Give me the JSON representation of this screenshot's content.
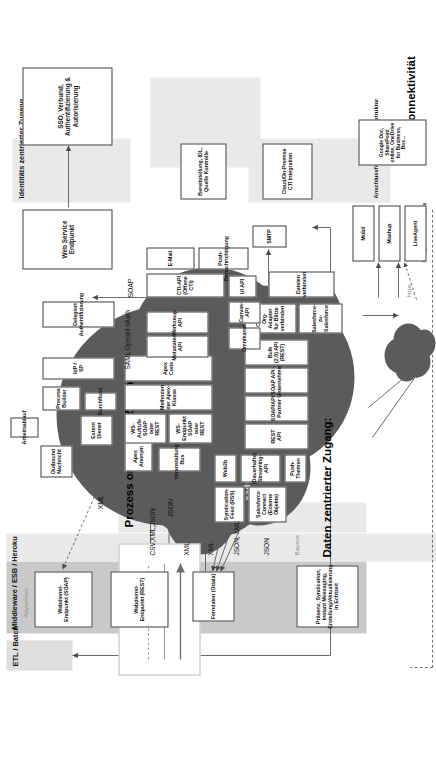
{
  "page": {
    "header_faint": "KAPITEL 6    CLOUD-SPEZIFISCHE ARCHITEKTUR",
    "language": "de"
  },
  "legend": {
    "title": "",
    "sync_label": "Sync",
    "async_label": "Asynchron",
    "arrow_icon": "arrow-up-icon"
  },
  "zones": {
    "etl_batch": "ETL / Batch",
    "middleware": "Middleware / ESB / Heroku",
    "data_centric": "Daten zentrierter Zugang:",
    "process_oriented": "Prozess orientierter Zugang",
    "identity_centric": "Identitäts zentrierter Zugang",
    "infrastructure": "Anschlussfähigkeit der Infrastruktur",
    "app_integration": "Integration von Apps",
    "cloud_connectivity": "Cloud-Konnektivität",
    "apex_side_label": "Apex"
  },
  "middleware_boxes": [
    {
      "id": "presence",
      "label": "Präsenz, Syndication, Instant Messaging, Erstellung/Aktualisierung in Echtzeit"
    },
    {
      "id": "remote-data",
      "label": "Ferndaten (Odata)"
    },
    {
      "id": "ws-rest",
      "label": "Webdienst-Endpunkt (REST)"
    },
    {
      "id": "ws-soap",
      "label": "Webdienst-Endpunkt (SOAP)"
    }
  ],
  "identity_boxes": [
    {
      "id": "sso",
      "label": "SSO, Verbund, Authentifizierung & Autorisierung"
    },
    {
      "id": "web-service-endpoint",
      "label": "Web Service Endpunkt"
    }
  ],
  "infrastructure_boxes": [
    {
      "id": "provisioning",
      "label": "Bereitstellung, IDL, Quelle Kontrolle"
    },
    {
      "id": "cti-integration",
      "label": "Cloud/On-Premise CTI Integration"
    }
  ],
  "app_boxes": [
    {
      "id": "mobil",
      "label": "Mobil"
    },
    {
      "id": "mashup",
      "label": "Mashup"
    },
    {
      "id": "liveagent",
      "label": "LiveAgent"
    }
  ],
  "cloud_boxes": {
    "data_layer": [
      {
        "id": "syndication-feed",
        "label": "Syndication-Feed (RSS)"
      },
      {
        "id": "salesforce-connect",
        "label": "Salesforce Connect (Externe Objekte)"
      },
      {
        "id": "web2b",
        "label": "Web2b"
      },
      {
        "id": "streaming-api",
        "label": "(Dauerhafte) Streaming-API"
      },
      {
        "id": "push-topics",
        "label": "Push-Themen"
      },
      {
        "id": "rest-api",
        "label": "REST API"
      },
      {
        "id": "soap-api-partner",
        "label": "SOAP/API Partner"
      },
      {
        "id": "soap-api-enterprise",
        "label": "SOAP API - Unternehmen"
      },
      {
        "id": "bulk-api",
        "label": "Bulk (2.0) API (REST)"
      },
      {
        "id": "cross-org-adapter",
        "label": "Cross-Org-Adapter für Blitze verbinden"
      },
      {
        "id": "salesforce-to-salesforce",
        "label": "Salesforce-zu-Salesforce"
      },
      {
        "id": "connect-files",
        "label": "Dateien verbinden"
      }
    ],
    "apex_layer": [
      {
        "id": "apex-anonymous",
        "label": "Apex Anonym"
      },
      {
        "id": "event-bus",
        "label": "Veranstaltungs-Bus"
      },
      {
        "id": "ws-endpoint",
        "label": "WS-Endpunkt SOAP oder REST"
      },
      {
        "id": "ws-callout",
        "label": "WS-Aufrufe SOAP oder REST"
      },
      {
        "id": "apex-class-methods",
        "label": "Methoden der Apex-Klasse"
      },
      {
        "id": "apex-code",
        "label": "Apex Code"
      }
    ],
    "process_layer": [
      {
        "id": "external-service",
        "label": "Extern Dienst"
      },
      {
        "id": "outbound-message",
        "label": "Outbound Nachricht"
      },
      {
        "id": "flow",
        "label": "Durchfluss"
      },
      {
        "id": "process-builder",
        "label": "Process Builder"
      },
      {
        "id": "workflow",
        "label": "Arbeitsablauf"
      },
      {
        "id": "idp-sp",
        "label": "IdP / SP"
      },
      {
        "id": "delegated-auth",
        "label": "Delegiert Authentifizierung"
      }
    ],
    "tooling_layer": [
      {
        "id": "metadata-api",
        "label": "Metadaten-API"
      },
      {
        "id": "tooling-api",
        "label": "Werkzeug-API"
      },
      {
        "id": "cti-api",
        "label": "CTI-API (Offene CTI)"
      },
      {
        "id": "email",
        "label": "E-Mail"
      },
      {
        "id": "smtp",
        "label": "SMTP"
      },
      {
        "id": "push-notification",
        "label": "Push-Benachrichtigung"
      },
      {
        "id": "ui-api",
        "label": "UI API"
      },
      {
        "id": "canvas-api",
        "label": "Canvas-API"
      },
      {
        "id": "omnichannel",
        "label": "Omnikanal"
      }
    ]
  },
  "cloud_services_box": {
    "id": "cloud-services",
    "label": "Google Doc, SharePoint online, OneDrive for Business, Box..."
  },
  "protocol_labels": [
    {
      "id": "bayeux",
      "label": "Bayeux"
    },
    {
      "id": "json-1",
      "label": "JSON"
    },
    {
      "id": "json-xml",
      "label": "JSON, XML"
    },
    {
      "id": "xml-1",
      "label": "XML"
    },
    {
      "id": "xml-2",
      "label": "XML"
    },
    {
      "id": "csv-xml-json",
      "label": "CSV,XML,JSON"
    },
    {
      "id": "json-2",
      "label": "JSON"
    },
    {
      "id": "xml-3",
      "label": "XML"
    },
    {
      "id": "saml-openid-oauth",
      "label": "SAML OpenId oAuth"
    },
    {
      "id": "soap",
      "label": "SOAP"
    },
    {
      "id": "https",
      "label": "https"
    }
  ],
  "colors": {
    "cloud_fill": "#5b5b5b",
    "band_grey": "#c9c9c9",
    "band_light": "#dedede",
    "box_border": "#3f3f3f",
    "box_fill": "#ffffff",
    "line": "#555555"
  }
}
